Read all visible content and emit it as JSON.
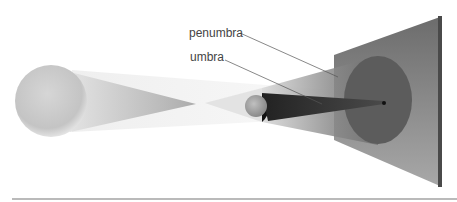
{
  "diagram": {
    "labels": {
      "penumbra": "penumbra",
      "umbra": "umbra"
    },
    "elements": [
      {
        "name": "light-source",
        "shape": "sphere",
        "center": [
          51,
          101
        ],
        "radius": 36,
        "color": "#c8c8c8"
      },
      {
        "name": "occluding-body",
        "shape": "sphere",
        "center": [
          258,
          105
        ],
        "radius": 12,
        "color": "#9a9a9a"
      },
      {
        "name": "umbra-cone",
        "shape": "cone",
        "apex": [
          384,
          102
        ],
        "color": "#3a3a3a"
      },
      {
        "name": "penumbra-region",
        "shape": "cone",
        "color": "#6a6a6a"
      },
      {
        "name": "projection-screen",
        "shape": "plane",
        "corners": [
          [
            334,
            55
          ],
          [
            441,
            16
          ],
          [
            441,
            186
          ],
          [
            334,
            140
          ]
        ],
        "color": "#7a7a7a"
      },
      {
        "name": "penumbra-disc-on-screen",
        "shape": "ellipse",
        "center": [
          378,
          100
        ],
        "rx": 34,
        "ry": 44,
        "color": "#5b5b5b"
      },
      {
        "name": "umbra-spot-on-screen",
        "shape": "dot",
        "center": [
          384,
          103
        ],
        "color": "#111111"
      }
    ],
    "colors": {
      "background": "#ffffff",
      "text": "#444444",
      "leader_line": "#555555",
      "rule": "#666666"
    }
  }
}
